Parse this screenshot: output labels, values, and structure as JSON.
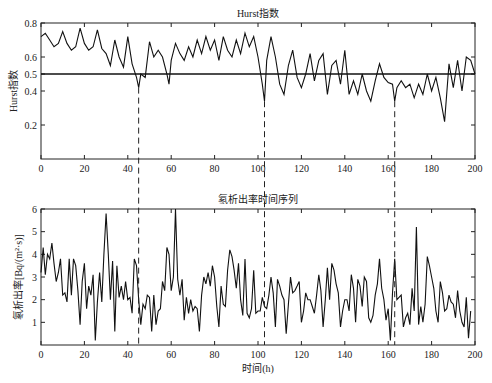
{
  "chart_data": [
    {
      "type": "line",
      "title": "Hurst指数",
      "xlabel": "",
      "ylabel": "Hurst指数",
      "xlim": [
        0,
        200
      ],
      "ylim": [
        0,
        0.8
      ],
      "xticks": [
        "0",
        "20",
        "40",
        "60",
        "80",
        "100",
        "120",
        "140",
        "160",
        "180",
        "200"
      ],
      "yticks": [
        "0.2",
        "0.4",
        "0.5",
        "0.6",
        "0.8"
      ],
      "reference_line": 0.5,
      "grid": false,
      "x": [
        0,
        2,
        4,
        6,
        8,
        10,
        12,
        14,
        16,
        18,
        20,
        22,
        24,
        26,
        28,
        30,
        32,
        34,
        36,
        38,
        40,
        42,
        44,
        45,
        46,
        48,
        50,
        52,
        54,
        56,
        58,
        59,
        60,
        62,
        64,
        66,
        68,
        70,
        72,
        74,
        76,
        78,
        80,
        82,
        84,
        86,
        88,
        90,
        92,
        94,
        96,
        98,
        100,
        102,
        103,
        104,
        106,
        108,
        110,
        112,
        114,
        116,
        118,
        120,
        122,
        124,
        126,
        128,
        130,
        132,
        134,
        136,
        138,
        140,
        142,
        144,
        146,
        148,
        150,
        152,
        154,
        156,
        158,
        160,
        162,
        163,
        164,
        166,
        168,
        170,
        172,
        174,
        176,
        178,
        180,
        182,
        184,
        186,
        188,
        190,
        192,
        194,
        196,
        198,
        200
      ],
      "values": [
        0.72,
        0.74,
        0.7,
        0.66,
        0.68,
        0.75,
        0.68,
        0.64,
        0.66,
        0.77,
        0.68,
        0.64,
        0.66,
        0.76,
        0.65,
        0.62,
        0.55,
        0.7,
        0.6,
        0.54,
        0.72,
        0.56,
        0.48,
        0.42,
        0.5,
        0.48,
        0.69,
        0.6,
        0.64,
        0.6,
        0.5,
        0.44,
        0.58,
        0.68,
        0.62,
        0.58,
        0.66,
        0.6,
        0.7,
        0.62,
        0.72,
        0.64,
        0.7,
        0.58,
        0.72,
        0.64,
        0.6,
        0.7,
        0.62,
        0.74,
        0.66,
        0.72,
        0.6,
        0.44,
        0.34,
        0.58,
        0.72,
        0.6,
        0.44,
        0.38,
        0.55,
        0.64,
        0.48,
        0.42,
        0.5,
        0.62,
        0.46,
        0.58,
        0.62,
        0.38,
        0.55,
        0.58,
        0.44,
        0.64,
        0.38,
        0.46,
        0.38,
        0.5,
        0.4,
        0.34,
        0.46,
        0.56,
        0.48,
        0.45,
        0.44,
        0.34,
        0.42,
        0.46,
        0.42,
        0.44,
        0.36,
        0.44,
        0.38,
        0.5,
        0.4,
        0.48,
        0.36,
        0.22,
        0.56,
        0.42,
        0.58,
        0.4,
        0.6,
        0.58,
        0.5
      ]
    },
    {
      "type": "line",
      "title": "氡析出率时间序列",
      "xlabel": "时间(h)",
      "ylabel": "氡析出率[Bq/(m²·s)]",
      "xlim": [
        0,
        200
      ],
      "ylim": [
        0,
        6
      ],
      "xticks": [
        "0",
        "20",
        "40",
        "60",
        "80",
        "100",
        "120",
        "140",
        "160",
        "180",
        "200"
      ],
      "yticks": [
        "1",
        "2",
        "3",
        "4",
        "5",
        "6"
      ],
      "grid": false,
      "x": [
        0,
        1,
        2,
        3,
        4,
        5,
        6,
        7,
        8,
        9,
        10,
        11,
        12,
        13,
        14,
        15,
        16,
        17,
        18,
        19,
        20,
        21,
        22,
        23,
        24,
        25,
        26,
        27,
        28,
        29,
        30,
        31,
        32,
        33,
        34,
        35,
        36,
        37,
        38,
        39,
        40,
        41,
        42,
        43,
        44,
        45,
        46,
        47,
        48,
        49,
        50,
        51,
        52,
        53,
        54,
        55,
        56,
        57,
        58,
        59,
        60,
        61,
        62,
        63,
        64,
        65,
        66,
        67,
        68,
        69,
        70,
        71,
        72,
        73,
        74,
        75,
        76,
        77,
        78,
        79,
        80,
        81,
        82,
        83,
        84,
        85,
        86,
        87,
        88,
        89,
        90,
        91,
        92,
        93,
        94,
        95,
        96,
        97,
        98,
        99,
        100,
        101,
        102,
        103,
        104,
        105,
        106,
        107,
        108,
        109,
        110,
        111,
        112,
        113,
        114,
        115,
        116,
        117,
        118,
        119,
        120,
        121,
        122,
        123,
        124,
        125,
        126,
        127,
        128,
        129,
        130,
        131,
        132,
        133,
        134,
        135,
        136,
        137,
        138,
        139,
        140,
        141,
        142,
        143,
        144,
        145,
        146,
        147,
        148,
        149,
        150,
        151,
        152,
        153,
        154,
        155,
        156,
        157,
        158,
        159,
        160,
        161,
        162,
        163,
        164,
        165,
        166,
        167,
        168,
        169,
        170,
        171,
        172,
        173,
        174,
        175,
        176,
        177,
        178,
        179,
        180,
        181,
        182,
        183,
        184,
        185,
        186,
        187,
        188,
        189,
        190,
        191,
        192,
        193,
        194,
        195,
        196,
        197,
        198
      ],
      "values": [
        3.2,
        4.3,
        3.1,
        4.0,
        3.8,
        4.5,
        3.6,
        2.8,
        3.2,
        3.8,
        2.2,
        2.3,
        1.9,
        3.8,
        2.2,
        3.8,
        3.5,
        2.4,
        0.9,
        2.8,
        3.6,
        1.6,
        2.6,
        2.2,
        3.1,
        0.2,
        1.9,
        3.2,
        1.9,
        4.0,
        5.8,
        4.0,
        2.0,
        3.7,
        0.6,
        3.5,
        2.1,
        2.6,
        2.0,
        2.8,
        2.0,
        2.1,
        1.4,
        3.8,
        3.5,
        2.0,
        0.9,
        1.8,
        1.6,
        2.2,
        2.1,
        0.6,
        2.2,
        0.9,
        1.5,
        1.6,
        2.8,
        2.4,
        4.3,
        4.0,
        2.4,
        3.0,
        6.0,
        2.9,
        2.2,
        2.9,
        1.1,
        2.1,
        1.4,
        2.0,
        1.5,
        1.7,
        1.6,
        0.6,
        2.2,
        3.0,
        2.7,
        3.2,
        2.6,
        3.5,
        3.0,
        1.7,
        0.8,
        2.6,
        1.8,
        1.7,
        3.3,
        4.2,
        3.9,
        3.3,
        2.5,
        3.6,
        2.0,
        1.3,
        3.8,
        1.4,
        1.2,
        1.6,
        3.3,
        1.4,
        1.5,
        1.5,
        2.1,
        1.7,
        1.6,
        2.2,
        3.0,
        2.3,
        0.8,
        2.9,
        2.6,
        2.2,
        2.0,
        0.5,
        1.8,
        3.0,
        2.3,
        2.4,
        2.6,
        2.8,
        1.0,
        1.5,
        2.3,
        2.0,
        2.0,
        1.7,
        1.4,
        2.2,
        3.1,
        2.4,
        0.8,
        2.0,
        3.4,
        2.0,
        3.6,
        3.3,
        2.7,
        2.3,
        0.8,
        1.5,
        2.0,
        2.0,
        1.5,
        3.1,
        2.5,
        1.0,
        2.9,
        2.6,
        1.7,
        3.0,
        2.8,
        1.2,
        1.0,
        1.3,
        2.2,
        2.7,
        3.8,
        2.5,
        2.0,
        1.1,
        1.6,
        0.2,
        2.3,
        3.8,
        2.0,
        2.1,
        2.2,
        0.8,
        1.2,
        1.4,
        0.9,
        2.5,
        1.5,
        5.2,
        0.9,
        1.7,
        1.0,
        1.8,
        3.9,
        3.5,
        3.0,
        2.5,
        1.5,
        1.0,
        2.8,
        2.3,
        1.5,
        1.6,
        2.2,
        1.9,
        1.8,
        1.2,
        2.4,
        1.5,
        1.0,
        0.8,
        2.1,
        0.3,
        1.5,
        0.9,
        1.0,
        1.3,
        1.6,
        1.7,
        1.7
      ]
    }
  ],
  "annotations": {
    "dashed_lines_x": [
      45,
      103,
      163
    ]
  }
}
